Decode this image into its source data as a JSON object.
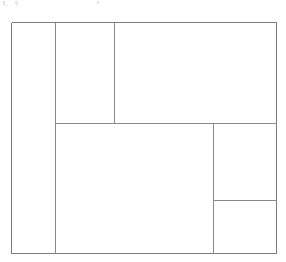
{
  "figure": {
    "background_color": "#ffffff",
    "line_color": "#8a8a8a",
    "outer_line_color": "#7d7d7d",
    "line_width": 1,
    "canvas": {
      "width": 286,
      "height": 262
    }
  },
  "outer_rectangle": {
    "name": "outer-boundary",
    "x": 11,
    "y": 22,
    "width": 265,
    "height": 231,
    "right": 276,
    "bottom": 253
  },
  "internal_lines": [
    {
      "name": "vertical-divider-left",
      "orientation": "vertical",
      "x": 55,
      "y1": 22,
      "y2": 253,
      "length": 231
    },
    {
      "name": "vertical-divider-upper-middle",
      "orientation": "vertical",
      "x": 114,
      "y1": 22,
      "y2": 123,
      "length": 101
    },
    {
      "name": "horizontal-divider-main",
      "orientation": "horizontal",
      "y": 123,
      "x1": 55,
      "x2": 276,
      "length": 221
    },
    {
      "name": "vertical-divider-lower-right",
      "orientation": "vertical",
      "x": 213,
      "y1": 123,
      "y2": 253,
      "length": 130
    },
    {
      "name": "horizontal-divider-right-lower",
      "orientation": "horizontal",
      "y": 200,
      "x1": 213,
      "x2": 276,
      "length": 63
    }
  ],
  "regions": [
    {
      "id": 1,
      "name": "region-left-tall",
      "label": "",
      "x": 11,
      "y": 22,
      "width": 44,
      "height": 231,
      "position": "far left, full height"
    },
    {
      "id": 2,
      "name": "region-top-middle",
      "label": "",
      "x": 55,
      "y": 22,
      "width": 59,
      "height": 101,
      "position": "upper middle"
    },
    {
      "id": 3,
      "name": "region-top-right-large",
      "label": "",
      "x": 114,
      "y": 22,
      "width": 162,
      "height": 101,
      "position": "upper right, largest top block"
    },
    {
      "id": 4,
      "name": "region-bottom-center-large",
      "label": "",
      "x": 55,
      "y": 123,
      "width": 158,
      "height": 130,
      "position": "lower center, largest bottom block"
    },
    {
      "id": 5,
      "name": "region-right-middle",
      "label": "",
      "x": 213,
      "y": 123,
      "width": 63,
      "height": 77,
      "position": "right side, middle"
    },
    {
      "id": 6,
      "name": "region-bottom-right-small",
      "label": "",
      "x": 213,
      "y": 200,
      "width": 63,
      "height": 53,
      "position": "bottom right corner"
    }
  ],
  "counts": {
    "regions": 6,
    "internal_lines": 5
  }
}
